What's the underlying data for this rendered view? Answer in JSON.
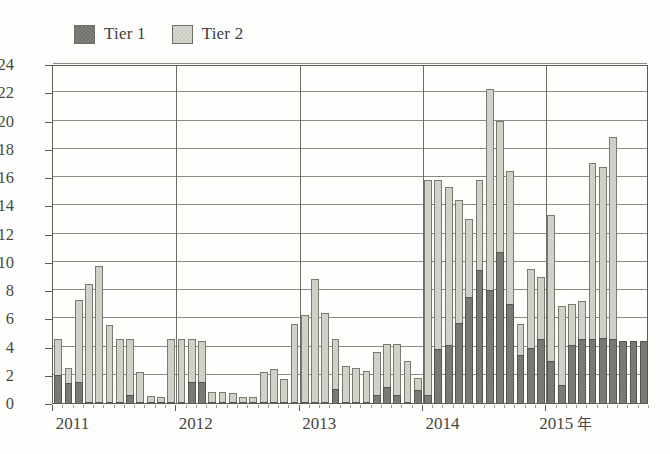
{
  "legend": {
    "position": "top-left",
    "items": [
      {
        "label": "Tier 1",
        "color": "#73726e",
        "icon": "square-swatch"
      },
      {
        "label": "Tier 2",
        "color": "#d5d6cd",
        "icon": "square-swatch"
      }
    ]
  },
  "axes": {
    "x_unit_label": "年",
    "year_labels": [
      "2011",
      "2012",
      "2013",
      "2014",
      "2015"
    ],
    "y_ticks": [
      24,
      22,
      20,
      18,
      16,
      14,
      12,
      10,
      8,
      6,
      4,
      2,
      0
    ]
  },
  "chart_data": {
    "type": "bar",
    "title": "",
    "subtitle": "",
    "xlabel": "年",
    "ylabel": "",
    "stacked": true,
    "grid": true,
    "legend_position": "top-left",
    "ylim": [
      0,
      24
    ],
    "ytick_step": 2,
    "x_axis_type": "monthly-time-series",
    "x_tick_labels": [
      "2011",
      "2012",
      "2013",
      "2014",
      "2015"
    ],
    "x_tick_positions": [
      0,
      12,
      24,
      36,
      48
    ],
    "categories": [
      "2011-01",
      "2011-02",
      "2011-03",
      "2011-04",
      "2011-05",
      "2011-06",
      "2011-07",
      "2011-08",
      "2011-09",
      "2011-10",
      "2011-11",
      "2011-12",
      "2012-01",
      "2012-02",
      "2012-03",
      "2012-04",
      "2012-05",
      "2012-06",
      "2012-07",
      "2012-08",
      "2012-09",
      "2012-10",
      "2012-11",
      "2012-12",
      "2013-01",
      "2013-02",
      "2013-03",
      "2013-04",
      "2013-05",
      "2013-06",
      "2013-07",
      "2013-08",
      "2013-09",
      "2013-10",
      "2013-11",
      "2013-12",
      "2014-01",
      "2014-02",
      "2014-03",
      "2014-04",
      "2014-05",
      "2014-06",
      "2014-07",
      "2014-08",
      "2014-09",
      "2014-10",
      "2014-11",
      "2014-12",
      "2015-01",
      "2015-02",
      "2015-03",
      "2015-04",
      "2015-05",
      "2015-06",
      "2015-07",
      "2015-08",
      "2015-09",
      "2015-10"
    ],
    "series": [
      {
        "name": "Tier 1",
        "color": "#73726e",
        "values": [
          2.0,
          1.4,
          1.5,
          0.1,
          0.1,
          0.1,
          0.1,
          0.6,
          0.1,
          0.1,
          0.1,
          0.1,
          0.1,
          1.5,
          1.5,
          0.1,
          0.1,
          0.1,
          0.1,
          0.1,
          0.1,
          0.1,
          0.1,
          0.1,
          0.1,
          0.1,
          0.1,
          1.0,
          0.1,
          0.1,
          0.1,
          0.6,
          1.1,
          0.6,
          0.1,
          0.9,
          0.6,
          3.8,
          4.1,
          5.7,
          7.5,
          9.4,
          8.0,
          10.7,
          7.0,
          3.4,
          3.9,
          4.5,
          3.0,
          1.3,
          4.1,
          4.5,
          4.5,
          4.6,
          4.5,
          4.4,
          4.4,
          4.4
        ]
      },
      {
        "name": "Tier 2",
        "color": "#d5d6cd",
        "values": [
          2.5,
          1.1,
          5.8,
          8.3,
          9.6,
          5.4,
          4.4,
          3.9,
          2.1,
          0.4,
          0.3,
          4.4,
          4.4,
          3.0,
          2.9,
          0.7,
          0.7,
          0.6,
          0.3,
          0.3,
          2.1,
          2.3,
          1.6,
          5.5,
          6.1,
          8.7,
          6.3,
          3.5,
          2.5,
          2.4,
          2.2,
          3.0,
          3.1,
          3.6,
          2.9,
          0.9,
          15.2,
          12.0,
          11.2,
          8.7,
          5.5,
          6.4,
          14.2,
          9.3,
          9.4,
          2.2,
          5.6,
          4.4,
          10.3,
          5.6,
          2.9,
          2.7,
          12.5,
          12.1,
          14.3,
          0.0,
          0.0,
          0.0
        ]
      }
    ]
  }
}
